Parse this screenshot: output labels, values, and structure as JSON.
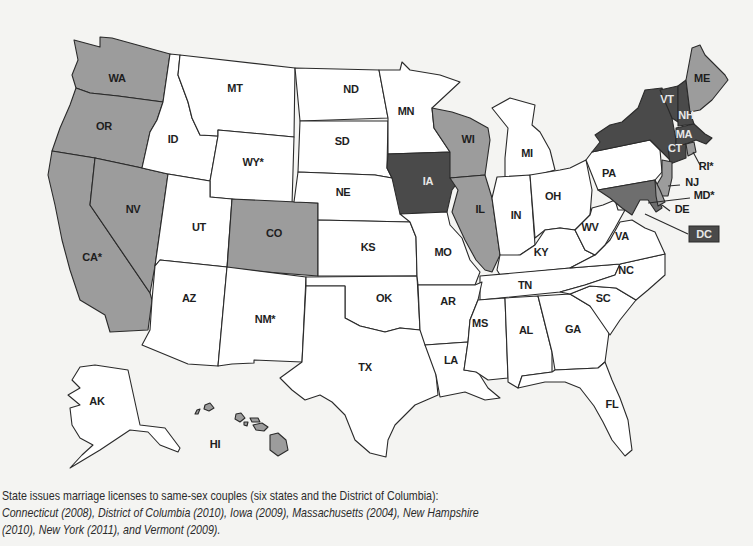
{
  "colors": {
    "background": "#f4f4f2",
    "none": "#ffffff",
    "partial": "#9c9c9c",
    "marriage": "#4a4a4a",
    "md": "#6e6e6e",
    "stroke": "#2a2a2a"
  },
  "states": [
    {
      "id": "WA",
      "label": "WA",
      "cat": "partial",
      "lx": 117,
      "ly": 82,
      "pts": "74,40 100,47 100,37 112,38 170,54 163,102 118,96 90,93 76,88 72,75 78,60"
    },
    {
      "id": "OR",
      "label": "OR",
      "cat": "partial",
      "lx": 104,
      "ly": 130,
      "pts": "76,88 90,93 118,96 163,102 157,120 150,132 142,168 95,158 52,151 60,128 70,105"
    },
    {
      "id": "CA",
      "label": "CA*",
      "cat": "partial",
      "lx": 92,
      "ly": 261,
      "pts": "52,151 95,158 90,205 150,293 152,300 148,330 110,332 105,315 80,300 70,270 62,240 55,205 48,175"
    },
    {
      "id": "NV",
      "label": "NV",
      "cat": "partial",
      "lx": 133,
      "ly": 213,
      "pts": "95,158 142,168 168,174 155,266 150,293 90,205"
    },
    {
      "id": "ID",
      "label": "ID",
      "cat": "none",
      "lx": 173,
      "ly": 143,
      "pts": "170,54 180,55 178,75 188,102 192,118 200,135 218,136 210,181 168,174 142,168 150,132 157,120 163,102"
    },
    {
      "id": "MT",
      "label": "MT",
      "cat": "none",
      "lx": 235,
      "ly": 92,
      "pts": "180,55 295,68 294,137 218,130 218,136 200,135 192,118 188,102 178,75"
    },
    {
      "id": "WY",
      "label": "WY*",
      "cat": "none",
      "lx": 253,
      "ly": 166,
      "pts": "218,130 294,137 292,205 210,197 210,181 218,136"
    },
    {
      "id": "UT",
      "label": "UT",
      "cat": "none",
      "lx": 199,
      "ly": 231,
      "pts": "168,174 210,181 210,197 232,199 227,267 160,260 155,266"
    },
    {
      "id": "CO",
      "label": "CO",
      "cat": "partial",
      "lx": 274,
      "ly": 237,
      "pts": "232,199 318,203 318,276 227,269"
    },
    {
      "id": "AZ",
      "label": "AZ",
      "cat": "none",
      "lx": 189,
      "ly": 302,
      "pts": "160,260 227,267 218,366 188,364 142,345 150,330 152,300 155,266"
    },
    {
      "id": "NM",
      "label": "NM*",
      "cat": "none",
      "lx": 265,
      "ly": 323,
      "pts": "227,267 306,277 302,362 254,360 254,363 232,364 218,366"
    },
    {
      "id": "ND",
      "label": "ND",
      "cat": "none",
      "lx": 351,
      "ly": 93,
      "pts": "295,68 379,70 388,118 300,121"
    },
    {
      "id": "SD",
      "label": "SD",
      "cat": "none",
      "lx": 342,
      "ly": 145,
      "pts": "300,121 388,121 387,168 392,178 375,175 298,172"
    },
    {
      "id": "NE",
      "label": "NE",
      "cat": "none",
      "lx": 343,
      "ly": 196,
      "pts": "298,172 375,175 392,178 400,192 410,222 318,220 318,203 294,202"
    },
    {
      "id": "KS",
      "label": "KS",
      "cat": "none",
      "lx": 368,
      "ly": 251,
      "pts": "318,220 410,222 416,237 417,276 318,276"
    },
    {
      "id": "OK",
      "label": "OK",
      "cat": "none",
      "lx": 384,
      "ly": 302,
      "pts": "306,277 417,276 420,330 400,328 385,332 360,326 345,318 345,286 306,286"
    },
    {
      "id": "TX",
      "label": "TX",
      "cat": "none",
      "lx": 365,
      "ly": 371,
      "pts": "306,286 345,286 345,318 360,326 385,332 400,328 420,330 432,332 436,375 438,395 415,405 395,425 388,440 386,457 370,453 355,440 345,415 332,402 320,395 305,400 292,390 280,378 302,362"
    },
    {
      "id": "MN",
      "label": "MN",
      "cat": "none",
      "lx": 406,
      "ly": 115,
      "pts": "379,70 400,70 402,62 410,70 440,75 460,82 432,108 434,128 450,152 388,154 388,118"
    },
    {
      "id": "IA",
      "label": "IA",
      "cat": "marriage",
      "lx": 428,
      "ly": 185,
      "pts": "388,154 450,152 455,162 460,170 458,182 452,190 447,212 400,214 392,178 387,168"
    },
    {
      "id": "MO",
      "label": "MO",
      "cat": "none",
      "lx": 443,
      "ly": 256,
      "pts": "400,214 447,212 450,225 462,238 470,260 480,272 475,285 418,285 417,276 416,237 410,222"
    },
    {
      "id": "WI",
      "label": "WI",
      "cat": "partial",
      "lx": 468,
      "ly": 143,
      "pts": "432,108 452,112 470,118 488,128 490,140 485,175 450,178 450,152 434,128"
    },
    {
      "id": "IL",
      "label": "IL",
      "cat": "partial",
      "lx": 480,
      "ly": 213,
      "pts": "450,178 485,175 492,198 500,255 492,272 485,270 476,260 465,240 458,225 452,212 458,190"
    },
    {
      "id": "MI",
      "label": "MI",
      "cat": "none",
      "lx": 527,
      "ly": 157,
      "pts": "492,108 510,98 535,105 532,125 540,132 550,150 555,170 530,177 505,178 505,158 508,128"
    },
    {
      "id": "IN",
      "label": "IN",
      "cat": "none",
      "lx": 516,
      "ly": 219,
      "pts": "497,177 530,175 535,245 520,255 505,258 500,255 492,198"
    },
    {
      "id": "OH",
      "label": "OH",
      "cat": "none",
      "lx": 553,
      "ly": 200,
      "pts": "530,175 560,170 570,168 586,160 592,190 590,215 575,230 560,228 545,230 535,238"
    },
    {
      "id": "KY",
      "label": "KY",
      "cat": "none",
      "lx": 541,
      "ly": 256,
      "pts": "497,270 500,255 520,255 535,245 545,230 560,228 575,230 585,250 595,255 570,268 500,275"
    },
    {
      "id": "TN",
      "label": "TN",
      "cat": "none",
      "lx": 525,
      "ly": 289,
      "pts": "480,276 570,268 620,264 615,275 585,285 560,292 480,300"
    },
    {
      "id": "AR",
      "label": "AR",
      "cat": "none",
      "lx": 448,
      "ly": 305,
      "pts": "418,285 475,285 482,282 478,300 470,320 468,342 425,345 420,330"
    },
    {
      "id": "LA",
      "label": "LA",
      "cat": "none",
      "lx": 451,
      "ly": 364,
      "pts": "425,345 468,342 464,370 478,372 488,388 500,398 485,400 465,392 440,397 436,375"
    },
    {
      "id": "MS",
      "label": "MS",
      "cat": "none",
      "lx": 480,
      "ly": 327,
      "pts": "478,300 505,298 508,378 488,380 476,372 464,370 468,342 470,320"
    },
    {
      "id": "AL",
      "label": "AL",
      "cat": "none",
      "lx": 526,
      "ly": 334,
      "pts": "505,298 538,296 552,352 552,372 522,376 518,388 508,382 508,378"
    },
    {
      "id": "GA",
      "label": "GA",
      "cat": "none",
      "lx": 573,
      "ly": 333,
      "pts": "538,296 570,294 590,306 610,325 605,362 598,368 555,370 552,352"
    },
    {
      "id": "FL",
      "label": "FL",
      "cat": "none",
      "lx": 612,
      "ly": 408,
      "pts": "522,376 552,372 555,370 598,368 605,362 612,380 620,398 628,420 632,450 625,456 612,440 603,422 594,406 580,388 565,382 545,382 518,388"
    },
    {
      "id": "SC",
      "label": "SC",
      "cat": "none",
      "lx": 603,
      "ly": 302,
      "pts": "570,294 590,286 616,288 636,300 620,320 610,335 590,306"
    },
    {
      "id": "NC",
      "label": "NC",
      "cat": "none",
      "lx": 626,
      "ly": 274,
      "pts": "560,292 585,285 615,275 620,264 665,254 665,275 648,290 636,300 616,288 590,286 570,294"
    },
    {
      "id": "VA",
      "label": "VA",
      "cat": "none",
      "lx": 622,
      "ly": 240,
      "pts": "570,268 595,255 610,240 620,222 632,220 645,228 655,232 665,254 620,264"
    },
    {
      "id": "WV",
      "label": "WV",
      "cat": "none",
      "lx": 590,
      "ly": 231,
      "pts": "575,230 590,215 592,208 603,205 615,200 618,210 625,210 615,228 605,245 595,255 585,250"
    },
    {
      "id": "PA",
      "label": "PA",
      "cat": "none",
      "lx": 609,
      "ly": 177,
      "pts": "586,160 592,152 650,140 660,150 662,172 655,180 598,190"
    },
    {
      "id": "NY",
      "label": "",
      "cat": "marriage",
      "lx": 0,
      "ly": 0,
      "pts": "592,152 600,142 595,135 610,125 622,122 638,108 645,90 662,88 672,118 676,140 676,150 670,160 660,150 650,140"
    },
    {
      "id": "VT",
      "label": "VT",
      "cat": "marriage",
      "lx": 667,
      "ly": 103,
      "pts": "660,90 678,86 678,122 672,118"
    },
    {
      "id": "NH",
      "label": "NH",
      "cat": "marriage",
      "lx": 686,
      "ly": 119,
      "pts": "678,86 686,80 690,112 694,124 678,126 678,122"
    },
    {
      "id": "ME",
      "label": "ME",
      "cat": "partial",
      "lx": 702,
      "ly": 82,
      "pts": "686,80 692,48 700,45 705,55 712,62 725,75 728,80 712,100 700,110 690,112"
    },
    {
      "id": "MA",
      "label": "MA",
      "cat": "marriage",
      "lx": 684,
      "ly": 138,
      "pts": "676,128 694,124 705,134 712,138 706,144 696,140 676,148"
    },
    {
      "id": "CT",
      "label": "CT",
      "cat": "marriage",
      "lx": 675,
      "ly": 152,
      "pts": "668,148 686,144 686,158 670,164"
    },
    {
      "id": "RI",
      "label": "",
      "cat": "partial",
      "lx": 0,
      "ly": 0,
      "pts": "686,144 694,142 696,152 688,156"
    },
    {
      "id": "NJ",
      "label": "",
      "cat": "partial",
      "lx": 0,
      "ly": 0,
      "pts": "662,160 672,162 672,178 668,196 660,196 656,186 662,176"
    },
    {
      "id": "MD",
      "label": "",
      "cat": "md",
      "lx": 0,
      "ly": 0,
      "pts": "598,190 655,180 658,196 662,208 656,212 648,200 640,200 632,215 622,208 610,198"
    },
    {
      "id": "DE",
      "label": "",
      "cat": "partial",
      "lx": 0,
      "ly": 0,
      "pts": "655,180 660,190 665,202 658,206 656,196"
    },
    {
      "id": "AK",
      "label": "AK",
      "cat": "none",
      "lx": 97,
      "ly": 405,
      "pts": "80,367 95,365 128,370 140,425 165,428 180,448 178,452 160,445 148,432 130,430 115,440 100,450 70,468 82,455 93,445 80,438 72,425 70,408 80,405 68,395 80,388 72,380"
    },
    {
      "id": "HI",
      "label": "HI",
      "cat": "partial",
      "lx": 215,
      "ly": 448,
      "pts": "270,435 278,433 286,440 288,450 278,456 270,450"
    }
  ],
  "hawaii_islands": [
    {
      "pts": "205,405 210,403 214,408 209,411 204,409"
    },
    {
      "pts": "197,410 200,409 198,414 195,414"
    },
    {
      "pts": "236,414 241,413 245,418 240,422 235,419"
    },
    {
      "pts": "250,418 258,418 260,422 252,422"
    },
    {
      "pts": "253,425 262,423 268,427 264,431 256,430"
    },
    {
      "pts": "244,422 248,422 247,426 244,425"
    }
  ],
  "callouts": [
    {
      "id": "RI",
      "label": "RI*",
      "tx": 706,
      "ty": 170,
      "x1": 693,
      "y1": 152,
      "x2": 700,
      "y2": 165,
      "inv": false
    },
    {
      "id": "NJ",
      "label": "NJ",
      "tx": 692,
      "ty": 186,
      "x1": 668,
      "y1": 186,
      "x2": 680,
      "y2": 185,
      "inv": false
    },
    {
      "id": "MD",
      "label": "MD*",
      "tx": 704,
      "ty": 199,
      "x1": 648,
      "y1": 203,
      "x2": 690,
      "y2": 198,
      "inv": false
    },
    {
      "id": "DE",
      "label": "DE",
      "tx": 682,
      "ty": 213,
      "x1": 662,
      "y1": 205,
      "x2": 670,
      "y2": 211,
      "inv": false
    },
    {
      "id": "DC",
      "label": "DC",
      "tx": 704,
      "ty": 238,
      "x1": 645,
      "y1": 214,
      "x2": 688,
      "y2": 234,
      "inv": true
    }
  ],
  "caption": {
    "line1": "State issues marriage licenses to same-sex couples (six states and the District of Columbia):",
    "line2": "Connecticut (2008), District of Columbia (2010), Iowa (2009), Massachusetts (2004), New Hampshire",
    "line3": "(2010), New York (2011), and Vermont (2009)."
  },
  "labels_inverted": [
    "IA",
    "VT",
    "NH",
    "MA",
    "CT"
  ]
}
